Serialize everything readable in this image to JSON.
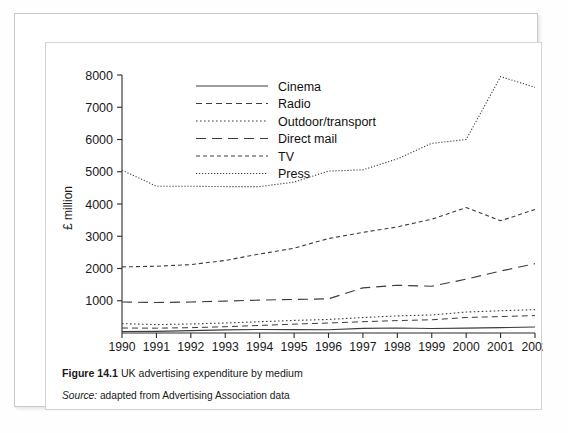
{
  "figure": {
    "number_label": "Figure 14.1",
    "caption_text": "UK advertising expenditure by medium",
    "source_label": "Source:",
    "source_text": "adapted from Advertising Association data"
  },
  "chart_data": {
    "type": "line",
    "title": "UK advertising expenditure by medium",
    "xlabel": "",
    "ylabel": "£ million",
    "x": [
      1990,
      1991,
      1992,
      1993,
      1994,
      1995,
      1996,
      1997,
      1998,
      1999,
      2000,
      2001,
      2002
    ],
    "xlim": [
      1990,
      2002
    ],
    "ylim": [
      0,
      8000
    ],
    "yticks": [
      1000,
      2000,
      3000,
      4000,
      5000,
      6000,
      7000,
      8000
    ],
    "xticks": [
      "1990",
      "1991",
      "1992",
      "1993",
      "1994",
      "1995",
      "1996",
      "1997",
      "1998",
      "1999",
      "2000",
      "2001",
      "2002"
    ],
    "grid": false,
    "legend_position": "top-left-inside",
    "series": [
      {
        "name": "Cinema",
        "dash": "solid",
        "values": [
          45,
          50,
          75,
          95,
          110,
          105,
          100,
          145,
          155,
          140,
          150,
          165,
          185
        ]
      },
      {
        "name": "Radio",
        "dash": "dashed-medium",
        "values": [
          155,
          150,
          165,
          195,
          235,
          275,
          310,
          350,
          385,
          410,
          480,
          510,
          540
        ]
      },
      {
        "name": "Outdoor/transport",
        "dash": "dotted",
        "values": [
          290,
          260,
          280,
          310,
          350,
          390,
          420,
          480,
          530,
          560,
          650,
          690,
          725
        ]
      },
      {
        "name": "Direct mail",
        "dash": "dashed-long",
        "values": [
          960,
          945,
          960,
          990,
          1020,
          1040,
          1060,
          1400,
          1480,
          1450,
          1670,
          1920,
          2150
        ]
      },
      {
        "name": "TV",
        "dash": "dash-dot",
        "values": [
          2050,
          2070,
          2120,
          2250,
          2450,
          2630,
          2930,
          3120,
          3290,
          3530,
          3890,
          3480,
          3830
        ]
      },
      {
        "name": "Press",
        "dash": "fine-dotted",
        "values": [
          5050,
          4550,
          4550,
          4540,
          4540,
          4680,
          5020,
          5060,
          5400,
          5880,
          6000,
          6500,
          7950
        ]
      }
    ],
    "press_extra_point": {
      "x": 2002,
      "value": 7620,
      "note": "Press dips at final year"
    },
    "series_note": "Press 2001 peak 7950, 2002 ~7620"
  },
  "legend": {
    "items": [
      {
        "label": "Cinema",
        "style": "solid"
      },
      {
        "label": "Radio",
        "style": "dashed-medium"
      },
      {
        "label": "Outdoor/transport",
        "style": "dotted"
      },
      {
        "label": "Direct mail",
        "style": "dashed-long"
      },
      {
        "label": "TV",
        "style": "dash-dot"
      },
      {
        "label": "Press",
        "style": "fine-dotted"
      }
    ]
  },
  "axes": {
    "y_title": "£ million",
    "y_labels": [
      "8000",
      "7000",
      "6000",
      "5000",
      "4000",
      "3000",
      "2000",
      "1000"
    ],
    "x_labels": [
      "1990",
      "1991",
      "1992",
      "1993",
      "1994",
      "1995",
      "1996",
      "1997",
      "1998",
      "1999",
      "2000",
      "2001",
      "2002"
    ]
  },
  "colors": {
    "line": "#3c3c3c",
    "axis": "#2b2b2b",
    "text": "#1a1a1a",
    "frame": "#d0d0d0",
    "page_background": "#ffffff"
  }
}
